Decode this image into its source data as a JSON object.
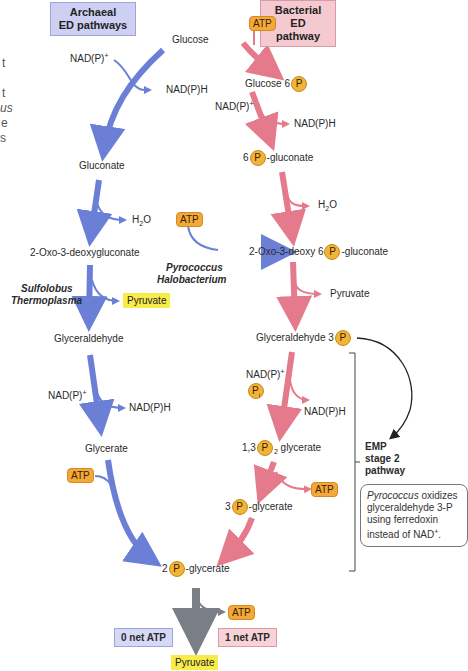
{
  "left_edge_fragments": [
    "t",
    "t",
    "us",
    "e",
    "s"
  ],
  "headers": {
    "archaeal": "Archaeal\nED pathways",
    "bacterial": "Bacterial\nED pathway"
  },
  "archaeal": {
    "glucose": "Glucose",
    "nadp_in_1": "NAD(P)",
    "nadph_out_1": "NAD(P)H",
    "gluconate": "Gluconate",
    "h2o": "H",
    "h2o_sub": "2",
    "h2o_tail": "O",
    "oxo": "2-Oxo-3-deoxygluconate",
    "organisms_1a": "Sulfolobus",
    "organisms_1b": "Thermoplasma",
    "pyruvate_1": "Pyruvate",
    "glyceraldehyde": "Glyceraldehyde",
    "nadp_in_2": "NAD(P)",
    "nadph_out_2": "NAD(P)H",
    "glycerate": "Glycerate",
    "atp_in": "ATP"
  },
  "cross": {
    "atp_in": "ATP",
    "organisms_a": "Pyrococcus",
    "organisms_b": "Halobacterium"
  },
  "bacterial": {
    "atp_in": "ATP",
    "glucose6p_pre": "Glucose 6",
    "p": "P",
    "nadp_in_1": "NAD(P)",
    "nadph_out_1": "NAD(P)H",
    "p6gluconate_pre": "6",
    "p6gluconate_post": "-gluconate",
    "h2o": "H",
    "h2o_sub": "2",
    "h2o_tail": "O",
    "kdpg_pre": "2-Oxo-3-deoxy 6",
    "kdpg_post": "-gluconate",
    "pyruvate": "Pyruvate",
    "gap_pre": "Glyceraldehyde 3",
    "nadp_in_2": "NAD(P)",
    "pi": "P",
    "pi_sub": "i",
    "nadph_out_2": "NAD(P)H",
    "bpg_pre": "1,3",
    "bpg_sub": "2",
    "bpg_post": " glycerate",
    "atp_out": "ATP",
    "pg3_pre": "3",
    "pg3_post": "-glycerate"
  },
  "common": {
    "pg2_pre": "2",
    "pg2_post": "-glycerate",
    "atp_out": "ATP",
    "pyruvate": "Pyruvate",
    "net_archaeal": "0 net ATP",
    "net_bacterial": "1 net ATP"
  },
  "emp": {
    "line1": "EMP",
    "line2": "stage 2",
    "line3": "pathway",
    "note_italic": "Pyrococcus",
    "note_rest1": " oxidizes",
    "note_line2": "glyceraldehyde 3-P",
    "note_line3": "using ferredoxin",
    "note_line4": "instead of NAD",
    "note_sup": "+",
    "note_end": "."
  },
  "colors": {
    "archaeal_arrow": "#6b7fd6",
    "bacterial_arrow": "#e57a8c",
    "common_arrow": "#7a7f86",
    "atp_fill": "#f2a93a",
    "phosphate_fill": "#f2b339",
    "pyruvate_fill": "#f8ec4a",
    "archaeal_header": "#cdd0f2",
    "bacterial_header": "#f4c9d0"
  }
}
